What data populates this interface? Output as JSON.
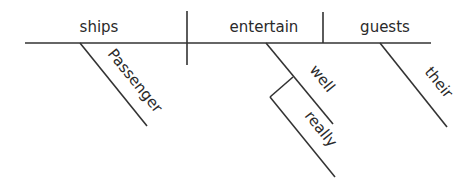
{
  "diagram": {
    "type": "sentence-diagram",
    "sentence": "Passenger ships really well entertain their guests",
    "colors": {
      "line": "#333333",
      "text": "#2a2a2a",
      "background": "#ffffff"
    },
    "baseline": {
      "subject": "ships",
      "verb": "entertain",
      "object": "guests"
    },
    "modifiers": {
      "subject_modifier": "Passenger",
      "verb_modifier": "well",
      "adverb_modifier": "really",
      "object_modifier": "their"
    }
  }
}
